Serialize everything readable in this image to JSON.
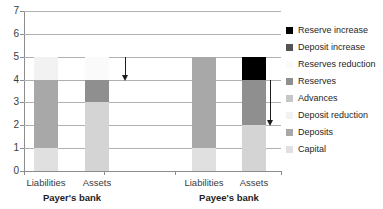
{
  "chart_data": {
    "type": "bar",
    "stacked": true,
    "title": "",
    "xlabel": "",
    "ylabel": "",
    "ylim": [
      0,
      7
    ],
    "ytick_values": [
      7,
      6,
      5,
      4,
      3,
      2,
      1,
      0
    ],
    "grid": true,
    "legend_position": "right",
    "groups": [
      {
        "name": "Payer's bank",
        "categories": [
          "Liabilities",
          "Assets"
        ]
      },
      {
        "name": "Payee's bank",
        "categories": [
          "Liabilities",
          "Assets"
        ]
      }
    ],
    "categories": [
      "Liabilities",
      "Assets",
      "Liabilities",
      "Assets"
    ],
    "bars": [
      {
        "group": "Payer's bank",
        "category": "Liabilities",
        "total": 5,
        "segments": [
          {
            "name": "Capital",
            "from": 0,
            "to": 1,
            "value": 1,
            "color": "#e0e0e0"
          },
          {
            "name": "Deposits",
            "from": 1,
            "to": 4,
            "value": 3,
            "color": "#a8a8a8"
          },
          {
            "name": "Deposit reduction",
            "from": 4,
            "to": 5,
            "value": 1,
            "color": "#f2f2f2"
          }
        ]
      },
      {
        "group": "Payer's bank",
        "category": "Assets",
        "total": 5,
        "segments": [
          {
            "name": "Advances",
            "from": 0,
            "to": 3,
            "value": 3,
            "color": "#d4d4d4"
          },
          {
            "name": "Reserves",
            "from": 3,
            "to": 4,
            "value": 1,
            "color": "#8f8f8f"
          },
          {
            "name": "Reserves reduction",
            "from": 4,
            "to": 5,
            "value": 1,
            "color": "#fafafa"
          }
        ]
      },
      {
        "group": "Payee's bank",
        "category": "Liabilities",
        "total": 5,
        "segments": [
          {
            "name": "Capital",
            "from": 0,
            "to": 1,
            "value": 1,
            "color": "#e0e0e0"
          },
          {
            "name": "Deposits",
            "from": 1,
            "to": 4,
            "value": 3,
            "color": "#a8a8a8"
          },
          {
            "name": "Deposit increase",
            "from": 4,
            "to": 5,
            "value": 1,
            "color": "#a8a8a8"
          }
        ]
      },
      {
        "group": "Payee's bank",
        "category": "Assets",
        "total": 5,
        "segments": [
          {
            "name": "Advances",
            "from": 0,
            "to": 2,
            "value": 2,
            "color": "#d4d4d4"
          },
          {
            "name": "Reserves",
            "from": 2,
            "to": 4,
            "value": 2,
            "color": "#8f8f8f"
          },
          {
            "name": "Reserve increase",
            "from": 4,
            "to": 5,
            "value": 1,
            "color": "#000000"
          }
        ]
      }
    ],
    "annotations": [
      {
        "name": "payer-reserves-decrease-arrow",
        "type": "arrow",
        "direction": "down",
        "from_y": 5,
        "to_y": 4
      },
      {
        "name": "payee-reserves-increase-arrow",
        "type": "arrow",
        "direction": "down",
        "from_y": 4,
        "to_y": 2
      }
    ],
    "legend": [
      {
        "label": "Reserve increase",
        "color": "#000000"
      },
      {
        "label": "Deposit increase",
        "color": "#545454"
      },
      {
        "label": "Reserves reduction",
        "color": "#fafafa"
      },
      {
        "label": "Reserves",
        "color": "#8f8f8f"
      },
      {
        "label": "Advances",
        "color": "#c6c6c6"
      },
      {
        "label": "Deposit reduction",
        "color": "#f2f2f2"
      },
      {
        "label": "Deposits",
        "color": "#a8a8a8"
      },
      {
        "label": "Capital",
        "color": "#e0e0e0"
      }
    ]
  }
}
